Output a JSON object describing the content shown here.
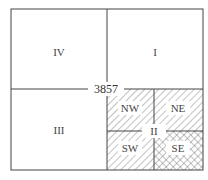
{
  "diagram": {
    "type": "quadtree-tile-subdivision",
    "center_label": "3857",
    "quadrants": [
      {
        "id": "IV",
        "label": "IV",
        "position": "top-left"
      },
      {
        "id": "I",
        "label": "I",
        "position": "top-right"
      },
      {
        "id": "III",
        "label": "III",
        "position": "bottom-left"
      },
      {
        "id": "II",
        "label": "II",
        "position": "bottom-right",
        "subdivided": true
      }
    ],
    "subquadrants": [
      {
        "id": "NW",
        "label": "NW",
        "pattern": "diagonal-hatch"
      },
      {
        "id": "NE",
        "label": "NE",
        "pattern": "diagonal-hatch"
      },
      {
        "id": "SW",
        "label": "SW",
        "pattern": "diagonal-hatch"
      },
      {
        "id": "SE",
        "label": "SE",
        "pattern": "cross-hatch"
      }
    ],
    "colors": {
      "line": "#444444",
      "hatch": "#555555",
      "background": "#ffffff"
    }
  }
}
